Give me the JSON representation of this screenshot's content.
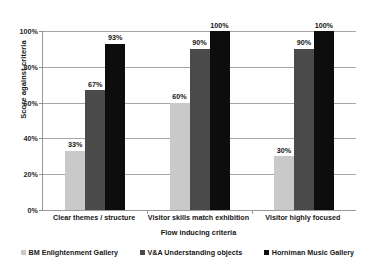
{
  "chart_data": {
    "type": "bar",
    "title": "",
    "xlabel": "Flow inducing criteria",
    "ylabel": "Score against criteria",
    "categories": [
      "Clear themes / structure",
      "Visitor skills match exhibition",
      "Visitor highly focused"
    ],
    "series": [
      {
        "name": "BM Enlightenment Gallery",
        "color": "#c9c9c9",
        "values": [
          33,
          60,
          30
        ],
        "labels": [
          "33%",
          "60%",
          "30%"
        ]
      },
      {
        "name": "V&A Understanding objects",
        "color": "#4a4a4a",
        "values": [
          67,
          90,
          90
        ],
        "labels": [
          "67%",
          "90%",
          "90%"
        ]
      },
      {
        "name": "Horniman Music Gallery",
        "color": "#0d0d0d",
        "values": [
          93,
          100,
          100
        ],
        "labels": [
          "93%",
          "100%",
          "100%"
        ]
      }
    ],
    "ylim": [
      0,
      100
    ],
    "ytick_values": [
      0,
      20,
      40,
      60,
      80,
      100
    ],
    "ytick_labels": [
      "0%",
      "20%",
      "40%",
      "60%",
      "80%",
      "100%"
    ],
    "grid": true,
    "legend_position": "bottom"
  }
}
